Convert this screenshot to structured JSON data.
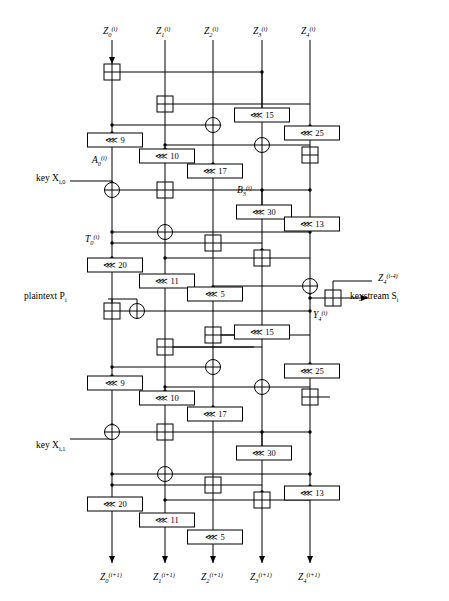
{
  "diagram": {
    "type": "crypto-datapath",
    "columns": [
      {
        "id": "z0",
        "x": 112,
        "top_label": "Z",
        "top_sub": "0",
        "top_sup": "(i)",
        "bottom_label": "Z",
        "bottom_sub": "0",
        "bottom_sup": "(i+1)"
      },
      {
        "id": "z1",
        "x": 165,
        "top_label": "Z",
        "top_sub": "1",
        "top_sup": "(i)",
        "bottom_label": "Z",
        "bottom_sub": "1",
        "bottom_sup": "(i+1)"
      },
      {
        "id": "z2",
        "x": 213,
        "top_label": "Z",
        "top_sub": "2",
        "top_sup": "(i)",
        "bottom_label": "Z",
        "bottom_sub": "2",
        "bottom_sup": "(i+1)"
      },
      {
        "id": "z3",
        "x": 262,
        "top_label": "Z",
        "top_sub": "3",
        "top_sup": "(i)",
        "bottom_label": "Z",
        "bottom_sub": "3",
        "bottom_sup": "(i+1)"
      },
      {
        "id": "z4",
        "x": 310,
        "top_label": "Z",
        "top_sub": "4",
        "top_sup": "(i)",
        "bottom_label": "Z",
        "bottom_sub": "4",
        "bottom_sup": "(i+1)"
      }
    ],
    "rotations": [
      {
        "id": "r15a",
        "amount": "15",
        "cx": 262,
        "cy": 115
      },
      {
        "id": "r9a",
        "amount": "9",
        "cx": 115,
        "cy": 140
      },
      {
        "id": "r25a",
        "amount": "25",
        "cx": 312,
        "cy": 133
      },
      {
        "id": "r10a",
        "amount": "10",
        "cx": 167,
        "cy": 156
      },
      {
        "id": "r17a",
        "amount": "17",
        "cx": 215,
        "cy": 171
      },
      {
        "id": "r30a",
        "amount": "30",
        "cx": 264,
        "cy": 212
      },
      {
        "id": "r13a",
        "amount": "13",
        "cx": 312,
        "cy": 224
      },
      {
        "id": "r20a",
        "amount": "20",
        "cx": 115,
        "cy": 265
      },
      {
        "id": "r11a",
        "amount": "11",
        "cx": 167,
        "cy": 281
      },
      {
        "id": "r5a",
        "amount": "5",
        "cx": 215,
        "cy": 294
      },
      {
        "id": "r15b",
        "amount": "15",
        "cx": 262,
        "cy": 332
      },
      {
        "id": "r9b",
        "amount": "9",
        "cx": 115,
        "cy": 383
      },
      {
        "id": "r25b",
        "amount": "25",
        "cx": 312,
        "cy": 371
      },
      {
        "id": "r10b",
        "amount": "10",
        "cx": 167,
        "cy": 398
      },
      {
        "id": "r17b",
        "amount": "17",
        "cx": 215,
        "cy": 414
      },
      {
        "id": "r30b",
        "amount": "30",
        "cx": 264,
        "cy": 453
      },
      {
        "id": "r13b",
        "amount": "13",
        "cx": 312,
        "cy": 493
      },
      {
        "id": "r20b",
        "amount": "20",
        "cx": 115,
        "cy": 504
      },
      {
        "id": "r11b",
        "amount": "11",
        "cx": 167,
        "cy": 520
      },
      {
        "id": "r5b",
        "amount": "5",
        "cx": 215,
        "cy": 537
      }
    ],
    "rotation_glyph": "⋘",
    "annotations": [
      {
        "id": "A0",
        "text": "A",
        "sub": "0",
        "sup": "(i)",
        "x": 92,
        "y": 163
      },
      {
        "id": "B3",
        "text": "B",
        "sub": "3",
        "sup": "(i)",
        "x": 237,
        "y": 193
      },
      {
        "id": "T0",
        "text": "T",
        "sub": "0",
        "sup": "(i)",
        "x": 85,
        "y": 242
      },
      {
        "id": "Y4",
        "text": "Y",
        "sub": "4",
        "sup": "(i)",
        "x": 313,
        "y": 318
      },
      {
        "id": "Z4m4",
        "text": "Z",
        "sub": "4",
        "sup": "(i-4)",
        "x": 378,
        "y": 281
      }
    ],
    "io_labels": [
      {
        "id": "key0",
        "text": "key X",
        "sub": "i,0",
        "x": 36,
        "y": 181
      },
      {
        "id": "plaintext",
        "text": "plaintext P",
        "sub": "i",
        "x": 24,
        "y": 299
      },
      {
        "id": "key1",
        "text": "key X",
        "sub": "i,1",
        "x": 36,
        "y": 448
      },
      {
        "id": "keystream",
        "text": "keystream S",
        "sub": "i",
        "x": 350,
        "y": 299
      }
    ],
    "adders": [
      {
        "id": "add-1",
        "cx": 112,
        "cy": 72
      },
      {
        "id": "add-2",
        "cx": 165,
        "cy": 104
      },
      {
        "id": "add-3",
        "cx": 310,
        "cy": 155
      },
      {
        "id": "add-4",
        "cx": 165,
        "cy": 190
      },
      {
        "id": "add-5",
        "cx": 213,
        "cy": 243
      },
      {
        "id": "add-6",
        "cx": 262,
        "cy": 258
      },
      {
        "id": "add-7",
        "cx": 112,
        "cy": 311
      },
      {
        "id": "add-8",
        "cx": 165,
        "cy": 347
      },
      {
        "id": "add-9",
        "cx": 213,
        "cy": 335
      },
      {
        "id": "add-10",
        "cx": 310,
        "cy": 397
      },
      {
        "id": "add-11",
        "cx": 165,
        "cy": 432
      },
      {
        "id": "add-12",
        "cx": 213,
        "cy": 485
      },
      {
        "id": "add-13",
        "cx": 262,
        "cy": 500
      },
      {
        "id": "add-ks",
        "cx": 333,
        "cy": 298
      }
    ],
    "xors": [
      {
        "id": "xor-1",
        "cx": 213,
        "cy": 125
      },
      {
        "id": "xor-2",
        "cx": 262,
        "cy": 145
      },
      {
        "id": "xor-3",
        "cx": 112,
        "cy": 190
      },
      {
        "id": "xor-4",
        "cx": 165,
        "cy": 232
      },
      {
        "id": "xor-5",
        "cx": 310,
        "cy": 286
      },
      {
        "id": "xor-6",
        "cx": 137,
        "cy": 311
      },
      {
        "id": "xor-7",
        "cx": 213,
        "cy": 367
      },
      {
        "id": "xor-8",
        "cx": 262,
        "cy": 387
      },
      {
        "id": "xor-9",
        "cx": 112,
        "cy": 432
      },
      {
        "id": "xor-10",
        "cx": 165,
        "cy": 474
      }
    ]
  }
}
